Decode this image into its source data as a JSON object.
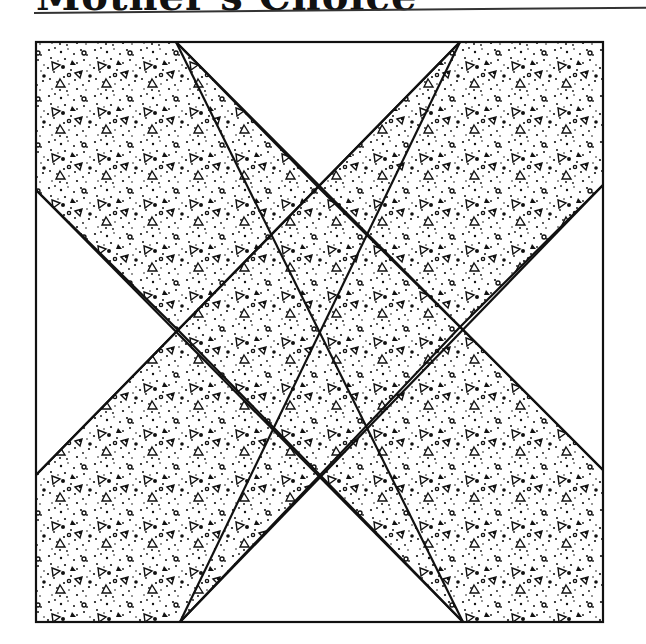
{
  "header": {
    "title": "Mother's Choice"
  },
  "block": {
    "name": "Mother's Choice quilt block",
    "outline_color": "#111111",
    "fill_pattern": "stippled dots and small triangles",
    "background_color": "#ffffff",
    "pieces": [
      "top-left band",
      "top-right band",
      "center square",
      "bottom-left band",
      "bottom-right band",
      "top triangle",
      "left triangle",
      "right triangle",
      "bottom triangle"
    ]
  }
}
